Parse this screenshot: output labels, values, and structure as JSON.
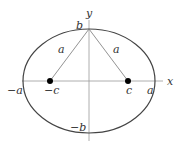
{
  "diagram": {
    "axes": {
      "x_label": "x",
      "y_label": "y"
    },
    "ellipse": {
      "center": [
        89,
        81
      ],
      "rx": 66,
      "ry": 52
    },
    "foci": [
      {
        "name": "left-focus",
        "label": "−c",
        "pos": [
          50,
          81
        ]
      },
      {
        "name": "right-focus",
        "label": "c",
        "pos": [
          128,
          81
        ]
      }
    ],
    "vertices": {
      "left": "−a",
      "right": "a",
      "top": "b",
      "bottom": "−b"
    },
    "segments": [
      {
        "name": "left-focal-segment",
        "label": "a"
      },
      {
        "name": "right-focal-segment",
        "label": "a"
      }
    ],
    "colors": {
      "stroke": "#333333",
      "axis": "#888888",
      "focus": "#000000"
    }
  }
}
